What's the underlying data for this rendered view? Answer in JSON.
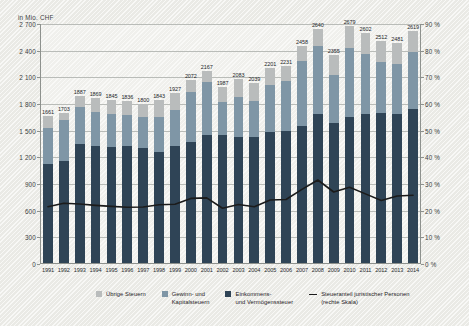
{
  "axis": {
    "y_left_title": "in Mio. CHF",
    "y_left_ticks": [
      "2 700",
      "2 400",
      "2 100",
      "1 800",
      "1 500",
      "1 200",
      "900",
      "600",
      "300",
      "0"
    ],
    "y_right_ticks": [
      "90 %",
      "80 %",
      "70 %",
      "60 %",
      "50 %",
      "40 %",
      "30 %",
      "20 %",
      "10 %",
      "0 %"
    ]
  },
  "legend": {
    "items": [
      {
        "name": "uebrige-steuern",
        "label": "Übrige Steuern",
        "color": "#b9bcbc"
      },
      {
        "name": "gewinn-kapitalsteuern",
        "label": "Gewinn- und\nKapitalsteuern",
        "color": "#7f96a6"
      },
      {
        "name": "einkommens-vermoegenssteuer",
        "label": "Einkommens-\nund Vermögenssteuer",
        "color": "#2f4456"
      },
      {
        "name": "steueranteil-juristischer-personen",
        "label": "Steueranteil juristischer Personen\n(rechte Skala)",
        "color": "#1b1b1b"
      }
    ]
  },
  "chart_data": {
    "type": "bar",
    "title": "",
    "xlabel": "",
    "ylabel": "in Mio. CHF",
    "ylabel_right": "%",
    "ylim": [
      0,
      2700
    ],
    "ylim_right": [
      0,
      90
    ],
    "ytick_step": 300,
    "ytick_step_right": 10,
    "grid": true,
    "legend_position": "bottom",
    "stacked": true,
    "categories": [
      "1991",
      "1992",
      "1993",
      "1994",
      "1995",
      "1996",
      "1997",
      "1998",
      "1999",
      "2000",
      "2001",
      "2002",
      "2003",
      "2004",
      "2005",
      "2006",
      "2007",
      "2008",
      "2009",
      "2010",
      "2011",
      "2012",
      "2013",
      "2014"
    ],
    "totals": [
      1661,
      1703,
      1887,
      1869,
      1845,
      1836,
      1800,
      1843,
      1927,
      2072,
      2167,
      1987,
      2083,
      2039,
      2201,
      2231,
      2458,
      2640,
      2355,
      2679,
      2602,
      2512,
      2481,
      2619
    ],
    "series": [
      {
        "name": "Einkommens- und Vermögenssteuer",
        "color": "#2f4456",
        "values": [
          1130,
          1160,
          1350,
          1325,
          1320,
          1330,
          1300,
          1255,
          1330,
          1375,
          1455,
          1455,
          1425,
          1430,
          1480,
          1500,
          1555,
          1690,
          1590,
          1655,
          1690,
          1700,
          1690,
          1740
        ]
      },
      {
        "name": "Gewinn- und Kapitalsteuern",
        "color": "#7f96a6",
        "values": [
          400,
          460,
          420,
          385,
          370,
          345,
          350,
          400,
          405,
          555,
          590,
          370,
          450,
          400,
          535,
          560,
          725,
          760,
          540,
          770,
          675,
          575,
          565,
          650
        ]
      },
      {
        "name": "Übrige Steuern",
        "color": "#b9bcbc",
        "values": [
          131,
          83,
          117,
          159,
          155,
          161,
          150,
          188,
          192,
          142,
          122,
          162,
          208,
          209,
          186,
          171,
          178,
          190,
          225,
          254,
          237,
          237,
          226,
          229
        ]
      }
    ],
    "line_series": {
      "name": "Steueranteil juristischer Personen (rechte Skala)",
      "color": "#1b1b1b",
      "axis": "right",
      "unit": "%",
      "values": [
        21.5,
        22.8,
        22.5,
        22.0,
        21.6,
        21.3,
        21.4,
        22.2,
        22.4,
        24.6,
        24.8,
        20.9,
        22.3,
        21.5,
        24.0,
        24.2,
        28.0,
        31.5,
        27.0,
        28.8,
        26.3,
        23.8,
        25.5,
        25.8
      ]
    }
  }
}
